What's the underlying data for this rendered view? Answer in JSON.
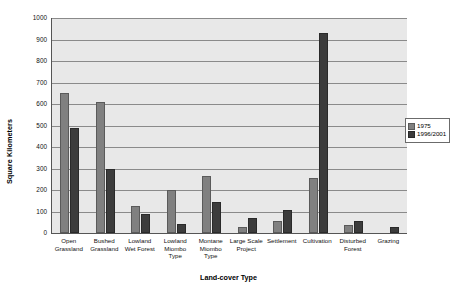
{
  "chart_data": {
    "type": "bar",
    "title": "",
    "xlabel": "Land-cover Type",
    "ylabel": "Square Kilometers",
    "ylim": [
      0,
      1000
    ],
    "ytick_step": 100,
    "yticks": [
      0,
      100,
      200,
      300,
      400,
      500,
      600,
      700,
      800,
      900,
      1000
    ],
    "ytick_labels": [
      "0",
      "100",
      "200",
      "300",
      "400",
      "500",
      "600",
      "700",
      "800",
      "900",
      "1000"
    ],
    "grid": true,
    "legend_position": "right",
    "categories": [
      "Open Grassland",
      "Bushed Grassland",
      "Lowland Wet Forest",
      "Lowland Miombo Type",
      "Montane Miombo Type",
      "Large Scale Project",
      "Settlement",
      "Cultivation",
      "Disturbed Forest",
      "Grazing"
    ],
    "series": [
      {
        "name": "1975",
        "color": "#808080",
        "values": [
          650,
          608,
          125,
          198,
          265,
          28,
          55,
          255,
          38,
          0
        ]
      },
      {
        "name": "1996/2001",
        "color": "#3c3c3c",
        "values": [
          487,
          298,
          88,
          42,
          145,
          68,
          108,
          930,
          58,
          30
        ]
      }
    ]
  },
  "legend": {
    "items": [
      {
        "label": "1975"
      },
      {
        "label": "1996/2001"
      }
    ]
  }
}
